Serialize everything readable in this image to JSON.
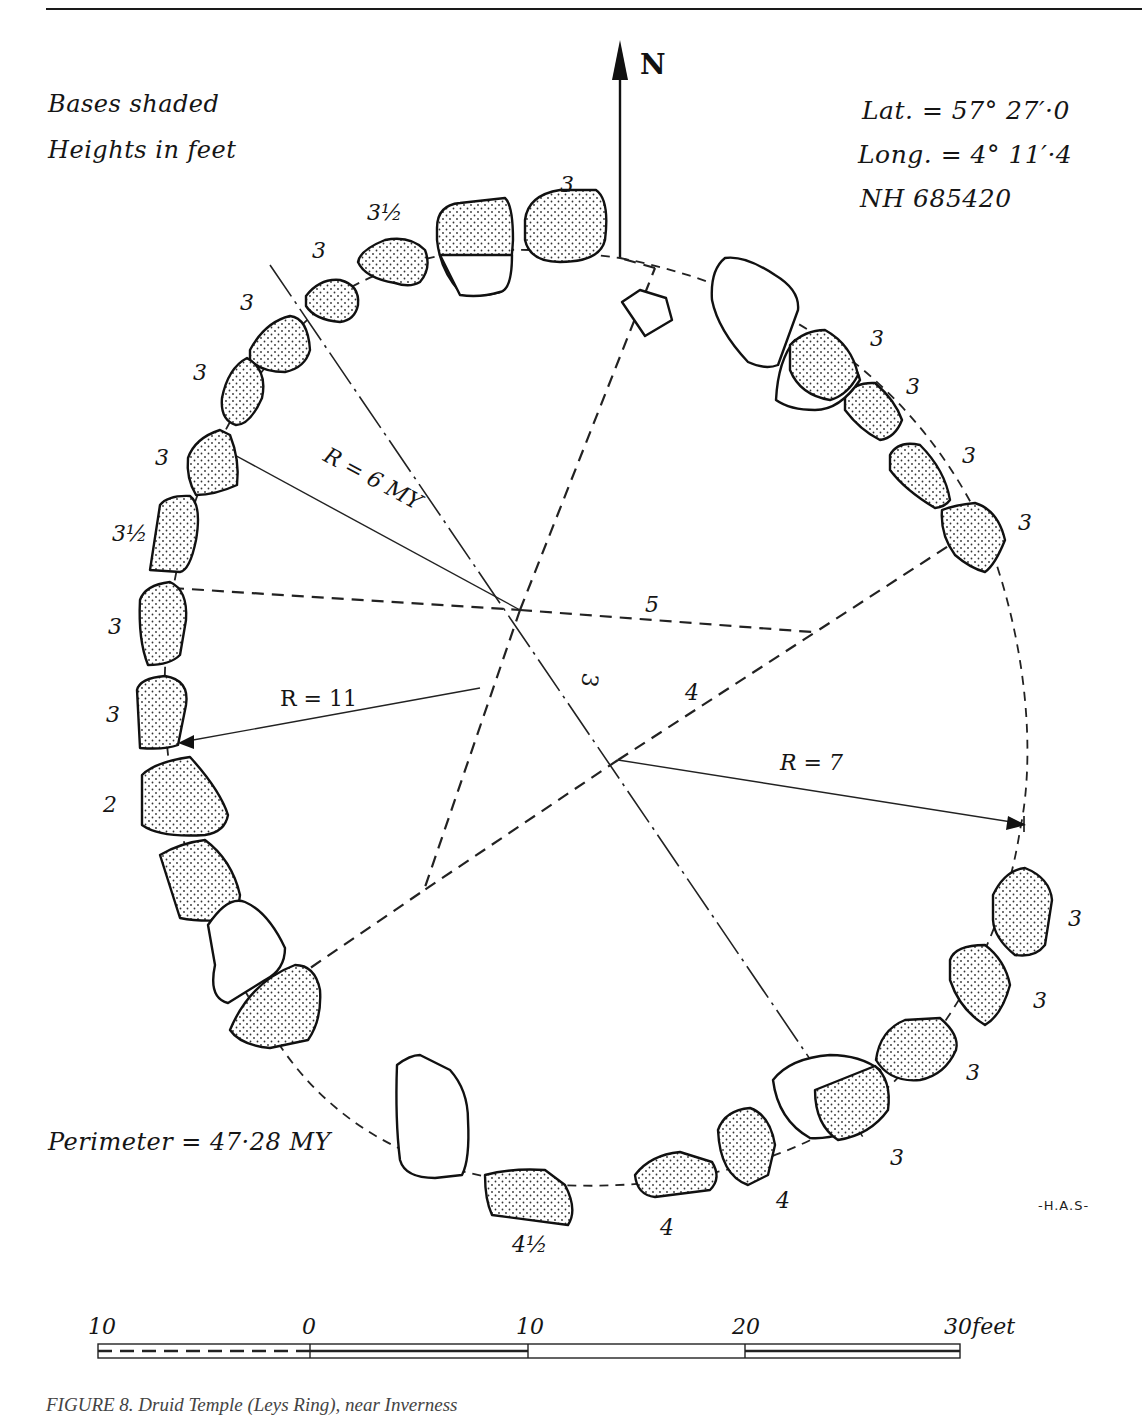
{
  "figure": {
    "type": "stone circle plan",
    "legend": {
      "line1": "Bases shaded",
      "line2": "Heights in feet"
    },
    "location": {
      "lat": "Lat.  = 57° 27′·0",
      "long": "Long. =  4° 11′·4",
      "grid_ref": "NH 685420"
    },
    "north_label": "N",
    "perimeter": "Perimeter = 47·28 MY",
    "initials": "-H.A.S-",
    "radii": {
      "r1": "R = 6 MY",
      "r2": "R = 11",
      "r3": "R = 7"
    },
    "construction_labels": {
      "side_5": "5",
      "side_4": "4",
      "side_3": "3"
    },
    "stone_heights": [
      {
        "id": "top-1",
        "label": "3"
      },
      {
        "id": "top-2",
        "label": "3½"
      },
      {
        "id": "top-3",
        "label": "3"
      },
      {
        "id": "nw-1",
        "label": "3"
      },
      {
        "id": "nw-2",
        "label": "3"
      },
      {
        "id": "w-1",
        "label": "3"
      },
      {
        "id": "w-2",
        "label": "3½"
      },
      {
        "id": "w-3",
        "label": "3"
      },
      {
        "id": "w-4",
        "label": "3"
      },
      {
        "id": "w-5",
        "label": "2"
      },
      {
        "id": "ne-1",
        "label": "3"
      },
      {
        "id": "ne-2",
        "label": "3"
      },
      {
        "id": "e-1",
        "label": "3"
      },
      {
        "id": "e-2",
        "label": "3"
      },
      {
        "id": "se-1",
        "label": "3"
      },
      {
        "id": "se-2",
        "label": "3"
      },
      {
        "id": "se-3",
        "label": "3"
      },
      {
        "id": "s-1",
        "label": "3"
      },
      {
        "id": "s-2",
        "label": "4"
      },
      {
        "id": "s-3",
        "label": "4"
      },
      {
        "id": "s-4",
        "label": "4½"
      }
    ],
    "scale_bar": {
      "labels": [
        "10",
        "0",
        "10",
        "20",
        "30"
      ],
      "unit": "feet"
    },
    "caption": "FIGURE 8. Druid Temple (Leys Ring), near Inverness"
  }
}
